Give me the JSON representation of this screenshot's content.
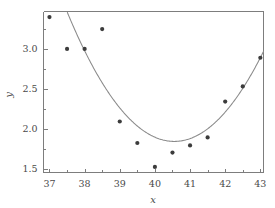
{
  "chart_data": {
    "type": "scatter",
    "title": "",
    "subtitle": "",
    "xlabel": "x",
    "ylabel": "y",
    "xlim": [
      36.83,
      43.09
    ],
    "ylim": [
      1.45,
      3.47
    ],
    "grid": false,
    "legend": false,
    "legend_position": "none",
    "x_ticks": [
      37,
      38,
      39,
      40,
      41,
      42,
      43
    ],
    "x_tick_labels": [
      "37",
      "38",
      "39",
      "40",
      "41",
      "42",
      "43"
    ],
    "x_minor_ticks": [
      37.5,
      38.5,
      39.5,
      40.5,
      41.5,
      42.5
    ],
    "y_ticks": [
      1.5,
      2.0,
      2.5,
      3.0
    ],
    "y_tick_labels": [
      "1.5",
      "2.0",
      "2.5",
      "3.0"
    ],
    "y_minor_ticks": [
      1.75,
      2.25,
      2.75,
      3.25
    ],
    "series": [
      {
        "name": "observations",
        "type": "scatter",
        "marker": "circle",
        "color": "#3c3c3c",
        "x": [
          37,
          37.5,
          38,
          38.5,
          39,
          39.5,
          40,
          40.5,
          41,
          41.5,
          42,
          42.5,
          43
        ],
        "y": [
          3.4,
          3.0,
          3.0,
          3.25,
          2.09,
          1.82,
          1.52,
          1.7,
          1.79,
          1.89,
          2.34,
          2.53,
          2.89
        ]
      },
      {
        "name": "fitted-curve",
        "type": "line",
        "color": "#8a8a8a",
        "description": "quadratic least-squares fit",
        "vertex_x": 40.55,
        "vertex_y": 1.84,
        "curvature": 0.175,
        "x": [
          37.2,
          37.6,
          38.0,
          38.4,
          38.8,
          39.2,
          39.6,
          40.0,
          40.4,
          40.8,
          41.2,
          41.6,
          42.0,
          42.4,
          42.8,
          43.0
        ],
        "y": [
          3.48,
          3.1,
          2.76,
          2.46,
          2.2,
          1.99,
          1.88,
          1.88,
          1.85,
          1.87,
          1.96,
          2.12,
          2.35,
          2.4,
          2.72,
          2.84
        ]
      }
    ]
  },
  "axes": {
    "x_axis_title": "x",
    "y_axis_title": "y"
  }
}
